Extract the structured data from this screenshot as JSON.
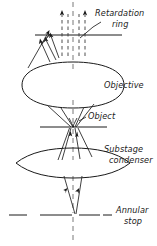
{
  "figure": {
    "labels": {
      "retardation_ring_line1": "Retardation",
      "retardation_ring_line2": "ring",
      "objective": "Objective",
      "object": "Object",
      "substage_condenser_line1": "Substage",
      "substage_condenser_line2": "condenser",
      "annular_stop_line1": "Annular",
      "annular_stop_line2": "stop"
    },
    "colors": {
      "ink": "#1a1a1a",
      "background": "#ffffff",
      "dashed": "#3a3a3a"
    },
    "components": [
      {
        "name": "retardation-ring",
        "y": 35,
        "kind": "plane"
      },
      {
        "name": "objective-lens",
        "y": 85,
        "kind": "lens"
      },
      {
        "name": "object-plane",
        "y": 127,
        "kind": "plane"
      },
      {
        "name": "substage-condenser-lens",
        "y": 163,
        "kind": "lens"
      },
      {
        "name": "annular-stop-plane",
        "y": 215,
        "kind": "plane"
      }
    ],
    "optical_axis_x": 73
  }
}
